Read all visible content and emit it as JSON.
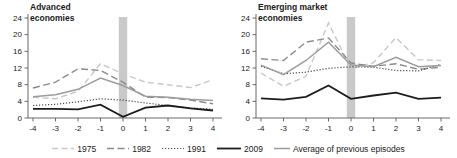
{
  "figure": {
    "band_color": "#c9c9c9",
    "axis_color": "#5a5a5a",
    "text_color": "#1a1a1a",
    "styles": {
      "y1975": {
        "color": "#c7c7c7",
        "dash": "6,3.5",
        "width": 1.4
      },
      "y1982": {
        "color": "#8a8a8a",
        "dash": "7,3.5",
        "width": 1.4
      },
      "y1991": {
        "color": "#4a4a4a",
        "dash": "1.2,1.8",
        "width": 1.2
      },
      "y2009": {
        "color": "#1c1c1c",
        "dash": "",
        "width": 1.8
      },
      "avg": {
        "color": "#9c9c9c",
        "dash": "",
        "width": 1.5
      }
    },
    "legend_items": [
      {
        "key": "y1975",
        "label": "1975"
      },
      {
        "key": "y1982",
        "label": "1982"
      },
      {
        "key": "y1991",
        "label": "1991"
      },
      {
        "key": "y2009",
        "label": "2009"
      },
      {
        "key": "avg",
        "label": "Average of previous episodes"
      }
    ]
  },
  "chart_data": [
    {
      "type": "line",
      "title": "Advanced economies",
      "title_lines": [
        "Advanced",
        "economies"
      ],
      "x": [
        -4,
        -3,
        -2,
        -1,
        0,
        1,
        2,
        3,
        4
      ],
      "xticks": [
        -4,
        -3,
        -2,
        -1,
        0,
        1,
        2,
        3,
        4
      ],
      "ylim": [
        0,
        24
      ],
      "yticks": [
        0,
        4,
        8,
        12,
        16,
        20,
        24
      ],
      "shaded_band_at_x": 0,
      "grid": false,
      "series": [
        {
          "key": "y1975",
          "name": "1975",
          "values": [
            5.0,
            4.6,
            6.4,
            13.0,
            10.6,
            8.6,
            8.0,
            7.3,
            9.2
          ]
        },
        {
          "key": "y1982",
          "name": "1982",
          "values": [
            7.2,
            8.6,
            11.8,
            11.4,
            8.6,
            5.0,
            4.9,
            4.3,
            3.4
          ]
        },
        {
          "key": "y1991",
          "name": "1991",
          "values": [
            3.0,
            3.3,
            3.9,
            4.6,
            4.3,
            3.6,
            3.0,
            2.4,
            2.1
          ]
        },
        {
          "key": "avg",
          "name": "Average of previous episodes",
          "values": [
            5.1,
            5.6,
            6.9,
            9.6,
            7.8,
            5.2,
            5.0,
            4.5,
            4.2
          ]
        },
        {
          "key": "y2009",
          "name": "2009",
          "values": [
            2.2,
            2.2,
            2.1,
            3.2,
            0.3,
            2.5,
            3.0,
            2.3,
            1.8
          ]
        }
      ]
    },
    {
      "type": "line",
      "title": "Emerging market economies",
      "title_lines": [
        "Emerging market",
        "economies"
      ],
      "x": [
        -4,
        -3,
        -2,
        -1,
        0,
        1,
        2,
        3,
        4
      ],
      "xticks": [
        -4,
        -3,
        -2,
        -1,
        0,
        1,
        2,
        3,
        4
      ],
      "ylim": [
        0,
        24
      ],
      "yticks": [
        0,
        4,
        8,
        12,
        16,
        20,
        24
      ],
      "shaded_band_at_x": 0,
      "grid": false,
      "series": [
        {
          "key": "y1975",
          "name": "1975",
          "values": [
            10.8,
            7.6,
            10.0,
            22.8,
            11.8,
            13.3,
            19.3,
            14.0,
            13.8
          ]
        },
        {
          "key": "y1982",
          "name": "1982",
          "values": [
            14.2,
            13.8,
            18.2,
            19.2,
            13.2,
            12.4,
            13.0,
            11.7,
            12.2
          ]
        },
        {
          "key": "y1991",
          "name": "1991",
          "values": [
            12.4,
            10.6,
            11.0,
            11.9,
            12.3,
            12.2,
            11.4,
            11.3,
            12.9
          ]
        },
        {
          "key": "avg",
          "name": "Average of previous episodes",
          "values": [
            12.7,
            10.4,
            13.8,
            18.2,
            12.7,
            12.3,
            14.6,
            12.3,
            12.6
          ]
        },
        {
          "key": "y2009",
          "name": "2009",
          "values": [
            4.7,
            4.4,
            5.1,
            7.8,
            4.6,
            5.4,
            6.1,
            4.6,
            4.9
          ]
        }
      ]
    }
  ]
}
